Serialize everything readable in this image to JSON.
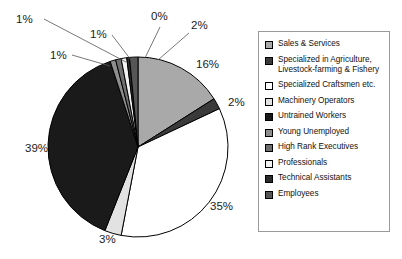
{
  "chart_data": {
    "type": "pie",
    "title": "",
    "labels_format": "percent",
    "legend_position": "right",
    "categories": [
      "Sales & Services",
      "Specialized in Agriculture, Livestock-farming & Fishery",
      "Specialized Craftsmen etc.",
      "Machinery Operators",
      "Untrained Workers",
      "Young Unemployed",
      "High Rank Executives",
      "Professionals",
      "Technical Assistants",
      "Employees"
    ],
    "values": [
      16,
      2,
      35,
      3,
      39,
      1,
      1,
      1,
      0,
      2
    ],
    "data_labels": [
      "16%",
      "2%",
      "35%",
      "3%",
      "39%",
      "1%",
      "1%",
      "1%",
      "0%",
      "2%"
    ],
    "colors": [
      "#a9a9a9",
      "#3a3a3a",
      "#ffffff",
      "#e2e2e2",
      "#1a1a1a",
      "#8d8d8d",
      "#6e6e6e",
      "#f2f2f2",
      "#2b2b2b",
      "#565656"
    ],
    "xlabel": "",
    "ylabel": ""
  },
  "pie": {
    "center_x": 138,
    "center_y": 147,
    "radius": 90,
    "slices": [
      {
        "name": "sales-and-services",
        "label": "16%",
        "value": 16,
        "color": "#a9a9a9",
        "start": 0,
        "end": 57.6,
        "label_x": 196,
        "label_y": 68,
        "leader": null
      },
      {
        "name": "agriculture-livestock",
        "label": "2%",
        "value": 2,
        "color": "#3a3a3a",
        "start": 57.6,
        "end": 64.8,
        "label_x": 228,
        "label_y": 106,
        "leader": null
      },
      {
        "name": "specialized-craftsmen",
        "label": "35%",
        "value": 35,
        "color": "#ffffff",
        "start": 64.8,
        "end": 190.8,
        "label_x": 210,
        "label_y": 210,
        "leader": null
      },
      {
        "name": "machinery-operators",
        "label": "3%",
        "value": 3,
        "color": "#e2e2e2",
        "start": 190.8,
        "end": 201.6,
        "label_x": 99,
        "label_y": 243,
        "leader": null
      },
      {
        "name": "untrained-workers",
        "label": "39%",
        "value": 39,
        "color": "#1a1a1a",
        "start": 201.6,
        "end": 342.0,
        "label_x": 25,
        "label_y": 152,
        "leader": null
      },
      {
        "name": "young-unemployed",
        "label": "1%",
        "value": 1,
        "color": "#8d8d8d",
        "start": 342.0,
        "end": 345.6,
        "label_x": 50,
        "label_y": 59,
        "leader": "M 72,55 L 110,66"
      },
      {
        "name": "high-rank-executives",
        "label": "1%",
        "value": 1,
        "color": "#6e6e6e",
        "start": 345.6,
        "end": 349.2,
        "label_x": 16,
        "label_y": 23,
        "leader": "M 44,19 L 126,62"
      },
      {
        "name": "professionals",
        "label": "1%",
        "value": 1,
        "color": "#f2f2f2",
        "start": 349.2,
        "end": 352.8,
        "label_x": 90,
        "label_y": 38,
        "leader": "M 112,35 L 131,60"
      },
      {
        "name": "technical-assistants",
        "label": "0%",
        "value": 0,
        "color": "#2b2b2b",
        "start": 352.8,
        "end": 354.6,
        "label_x": 151,
        "label_y": 20,
        "leader": "M 160,27 L 145,58"
      },
      {
        "name": "employees",
        "label": "2%",
        "value": 2,
        "color": "#565656",
        "start": 354.6,
        "end": 360.0,
        "label_x": 191,
        "label_y": 29,
        "leader": "M 189,33 L 158,60"
      }
    ]
  },
  "legend": {
    "items": [
      {
        "label": "Sales & Services",
        "color": "#a9a9a9",
        "name": "legend-sales-and-services"
      },
      {
        "label": "Specialized in Agriculture,\nLivestock-farming & Fishery",
        "color": "#3a3a3a",
        "name": "legend-agriculture-livestock"
      },
      {
        "label": "Specialized Craftsmen etc.",
        "color": "#ffffff",
        "name": "legend-specialized-craftsmen"
      },
      {
        "label": "Machinery Operators",
        "color": "#e2e2e2",
        "name": "legend-machinery-operators"
      },
      {
        "label": "Untrained Workers",
        "color": "#1a1a1a",
        "name": "legend-untrained-workers"
      },
      {
        "label": "Young Unemployed",
        "color": "#8d8d8d",
        "name": "legend-young-unemployed"
      },
      {
        "label": "High Rank Executives",
        "color": "#6e6e6e",
        "name": "legend-high-rank-executives"
      },
      {
        "label": "Professionals",
        "color": "#f2f2f2",
        "name": "legend-professionals"
      },
      {
        "label": "Technical Assistants",
        "color": "#2b2b2b",
        "name": "legend-technical-assistants"
      },
      {
        "label": "Employees",
        "color": "#565656",
        "name": "legend-employees"
      }
    ]
  }
}
